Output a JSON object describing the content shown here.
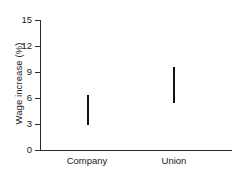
{
  "chart_data": {
    "type": "bar",
    "title": "",
    "xlabel": "",
    "ylabel": "Wage increase (%)",
    "categories": [
      "Company",
      "Union"
    ],
    "series": [
      {
        "name": "range",
        "ranges": [
          {
            "category": "Company",
            "low": 2.9,
            "high": 6.3
          },
          {
            "category": "Union",
            "low": 5.4,
            "high": 9.6
          }
        ]
      }
    ],
    "ylim": [
      0,
      15
    ],
    "yticks": [
      0,
      3,
      6,
      9,
      12,
      15
    ],
    "ytick_labels": [
      "0",
      "3",
      "6",
      "9",
      "12",
      "15"
    ],
    "grid": false,
    "legend": false
  },
  "axes": {
    "y_title": "Wage increase (%)",
    "y_ticks": [
      {
        "label": "15",
        "value": 15
      },
      {
        "label": "12",
        "value": 12
      },
      {
        "label": "9",
        "value": 9
      },
      {
        "label": "6",
        "value": 6
      },
      {
        "label": "3",
        "value": 3
      },
      {
        "label": "0",
        "value": 0
      }
    ],
    "x_categories": [
      {
        "label": "Company"
      },
      {
        "label": "Union"
      }
    ]
  },
  "colors": {
    "axis": "#2b2b2b",
    "series": "#111111",
    "background": "#ffffff",
    "text": "#1a1a1a"
  }
}
